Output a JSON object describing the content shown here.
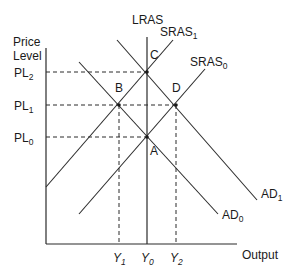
{
  "diagram": {
    "type": "AD-AS model",
    "y_axis_label_line1": "Price",
    "y_axis_label_line2": "Level",
    "x_axis_label": "Output",
    "price_levels": [
      {
        "base": "PL",
        "sub": "2",
        "y": 72
      },
      {
        "base": "PL",
        "sub": "1",
        "y": 105
      },
      {
        "base": "PL",
        "sub": "0",
        "y": 137
      }
    ],
    "output_levels": [
      {
        "base": "Y",
        "sub": "1",
        "x": 119
      },
      {
        "base": "Y",
        "sub": "0",
        "x": 147
      },
      {
        "base": "Y",
        "sub": "2",
        "x": 176
      }
    ],
    "curves": {
      "lras": {
        "label": "LRAS"
      },
      "sras1": {
        "base": "SRAS",
        "sub": "1"
      },
      "sras0": {
        "base": "SRAS",
        "sub": "0"
      },
      "ad1": {
        "base": "AD",
        "sub": "1"
      },
      "ad0": {
        "base": "AD",
        "sub": "0"
      }
    },
    "points": {
      "a": "A",
      "b": "B",
      "c": "C",
      "d": "D"
    },
    "colors": {
      "line": "#2b2b2b",
      "text": "#1a1a1a",
      "background": "#ffffff"
    }
  }
}
